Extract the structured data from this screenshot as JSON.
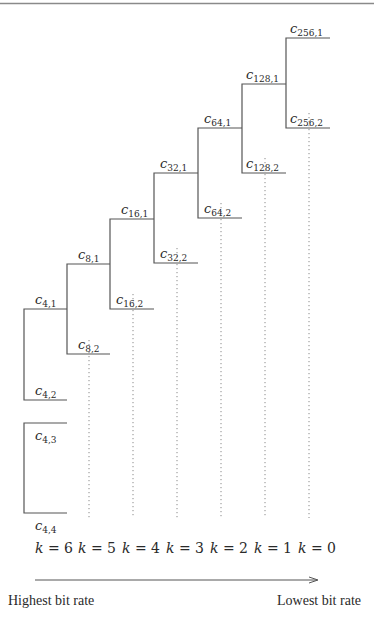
{
  "header": {
    "running_head": "ADAPTIVE STREAMING CODING"
  },
  "diagram": {
    "nodes": [
      {
        "id": "c256_1",
        "base": "c",
        "sub": "256,1"
      },
      {
        "id": "c256_2",
        "base": "c",
        "sub": "256,2"
      },
      {
        "id": "c128_1",
        "base": "c",
        "sub": "128,1"
      },
      {
        "id": "c128_2",
        "base": "c",
        "sub": "128,2"
      },
      {
        "id": "c64_1",
        "base": "c",
        "sub": "64,1"
      },
      {
        "id": "c64_2",
        "base": "c",
        "sub": "64,2"
      },
      {
        "id": "c32_1",
        "base": "c",
        "sub": "32,1"
      },
      {
        "id": "c32_2",
        "base": "c",
        "sub": "32,2"
      },
      {
        "id": "c16_1",
        "base": "c",
        "sub": "16,1"
      },
      {
        "id": "c16_2",
        "base": "c",
        "sub": "16,2"
      },
      {
        "id": "c8_1",
        "base": "c",
        "sub": "8,1"
      },
      {
        "id": "c8_2",
        "base": "c",
        "sub": "8,2"
      },
      {
        "id": "c4_1",
        "base": "c",
        "sub": "4,1"
      },
      {
        "id": "c4_2",
        "base": "c",
        "sub": "4,2"
      },
      {
        "id": "c4_3",
        "base": "c",
        "sub": "4,3"
      },
      {
        "id": "c4_4",
        "base": "c",
        "sub": "4,4"
      }
    ],
    "levels": [
      {
        "var": "k",
        "eq": " = 6"
      },
      {
        "var": "k",
        "eq": " = 5"
      },
      {
        "var": "k",
        "eq": " = 4"
      },
      {
        "var": "k",
        "eq": " = 3"
      },
      {
        "var": "k",
        "eq": " = 2"
      },
      {
        "var": "k",
        "eq": " = 1"
      },
      {
        "var": "k",
        "eq": " = 0"
      }
    ],
    "axis": {
      "left_label": "Highest bit rate",
      "right_label": "Lowest bit rate"
    }
  }
}
